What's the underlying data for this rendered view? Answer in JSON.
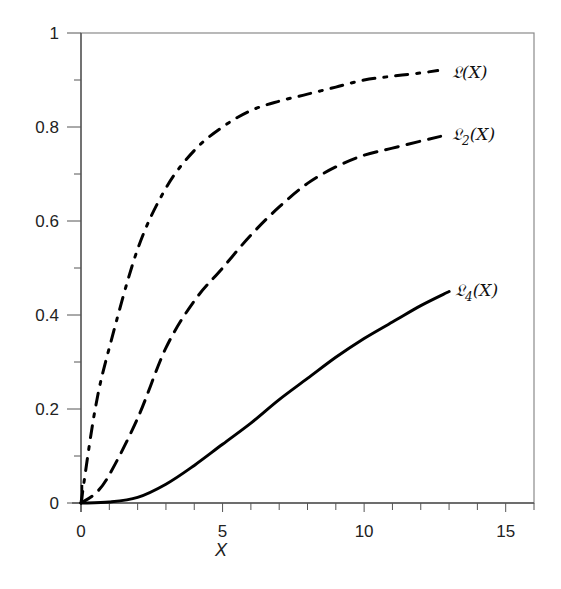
{
  "chart_data": {
    "type": "line",
    "title": "",
    "xlabel": "X",
    "ylabel": "",
    "xlim": [
      0,
      16
    ],
    "ylim": [
      0,
      1
    ],
    "x_ticks": [
      0,
      5,
      10,
      15
    ],
    "x_minor_step": 1,
    "y_ticks": [
      0,
      0.2,
      0.4,
      0.6,
      0.8,
      1
    ],
    "y_tick_labels": [
      "0",
      "0.2",
      "0.4",
      "0.6",
      "0.8",
      "1"
    ],
    "y_minor_step": 0.1,
    "grid": false,
    "legend_position": "inline-right-of-curves",
    "series": [
      {
        "name": "𝔏(X)",
        "label_main": "𝔏(X)",
        "label_sub": "",
        "line_style": "dash-dot",
        "color": "#000000",
        "x": [
          0,
          0.5,
          1,
          2,
          3,
          4,
          5,
          6,
          7,
          8,
          9,
          10,
          11,
          12,
          12.6
        ],
        "values": [
          0,
          0.2,
          0.33,
          0.54,
          0.67,
          0.75,
          0.8,
          0.835,
          0.855,
          0.87,
          0.885,
          0.9,
          0.908,
          0.915,
          0.92
        ]
      },
      {
        "name": "𝔏₂(X)",
        "label_main": "𝔏",
        "label_sub": "2",
        "label_tail": "(X)",
        "line_style": "dashed",
        "color": "#000000",
        "x": [
          0,
          0.5,
          1,
          2,
          3,
          4,
          5,
          6,
          7,
          8,
          9,
          10,
          11,
          12,
          12.7
        ],
        "values": [
          0,
          0.02,
          0.06,
          0.18,
          0.33,
          0.43,
          0.5,
          0.57,
          0.63,
          0.68,
          0.715,
          0.74,
          0.755,
          0.77,
          0.78
        ]
      },
      {
        "name": "𝔏₄(X)",
        "label_main": "𝔏",
        "label_sub": "4",
        "label_tail": "(X)",
        "line_style": "solid",
        "color": "#000000",
        "x": [
          0,
          1,
          2,
          3,
          4,
          5,
          6,
          7,
          8,
          9,
          10,
          11,
          12,
          13
        ],
        "values": [
          0,
          0.002,
          0.012,
          0.04,
          0.08,
          0.125,
          0.17,
          0.22,
          0.265,
          0.31,
          0.35,
          0.385,
          0.42,
          0.45
        ]
      }
    ]
  },
  "labels": {
    "series_0": "𝔏(X)",
    "series_1_main": "𝔏",
    "series_1_sub": "2",
    "series_1_tail": "(X)",
    "series_2_main": "𝔏",
    "series_2_sub": "4",
    "series_2_tail": "(X)",
    "x_axis": "X"
  }
}
